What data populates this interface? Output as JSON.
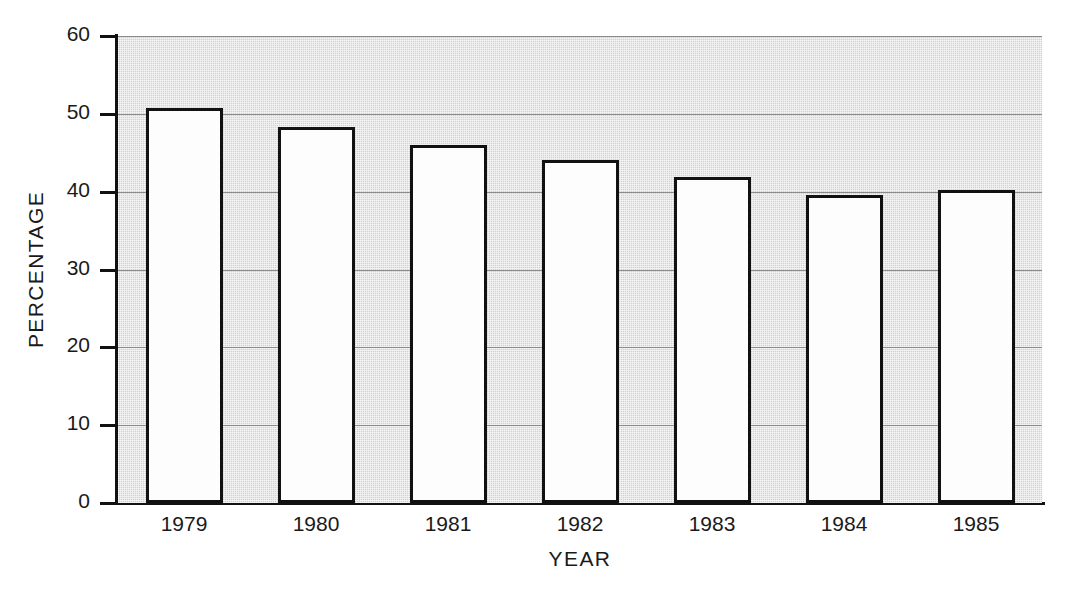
{
  "chart_data": {
    "type": "bar",
    "title": "",
    "subtitle": "",
    "xlabel": "YEAR",
    "ylabel": "PERCENTAGE",
    "categories": [
      "1979",
      "1980",
      "1981",
      "1982",
      "1983",
      "1984",
      "1985"
    ],
    "values": [
      50.8,
      48.3,
      46.0,
      44.1,
      41.9,
      39.6,
      40.2
    ],
    "series": [
      {
        "name": "Percentage",
        "values": [
          50.8,
          48.3,
          46.0,
          44.1,
          41.9,
          39.6,
          40.2
        ]
      }
    ],
    "ylim": [
      0,
      60
    ],
    "ytick_labels": [
      "0",
      "10",
      "20",
      "30",
      "40",
      "50",
      "60"
    ],
    "ytick_values": [
      0,
      10,
      20,
      30,
      40,
      50,
      60
    ],
    "grid": true,
    "grid_axis": "y",
    "legend": false,
    "legend_position": "none",
    "bar_fill_color": "#fdfdfd",
    "bar_edge_color": "#111111",
    "plot_background_color": "#d2d2d2",
    "gridline_color": "#8c8c8c",
    "axis_color": "#111111",
    "figure_background_color": "#ffffff"
  }
}
